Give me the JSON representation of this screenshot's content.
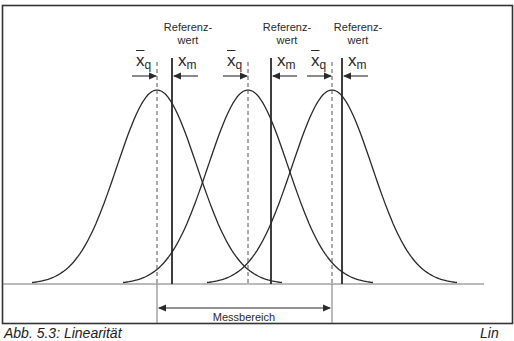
{
  "diagram": {
    "reference_label_line1": "Referenz-",
    "reference_label_line2": "wert",
    "groups": [
      {
        "peak_x": 157,
        "ref_x": 172,
        "xq_label": "x",
        "xq_sub": "q",
        "xm_label": "x",
        "xm_sub": "m",
        "show_ref_label": true
      },
      {
        "peak_x": 248,
        "ref_x": 271,
        "xq_label": "x",
        "xq_sub": "q",
        "xm_label": "x",
        "xm_sub": "m",
        "show_ref_label": true
      },
      {
        "peak_x": 332,
        "ref_x": 342,
        "xq_label": "x",
        "xq_sub": "q",
        "xm_label": "x",
        "xm_sub": "m",
        "show_ref_label": true
      }
    ],
    "range_label": "Messbereich",
    "range_start_x": 157,
    "range_end_x": 332,
    "baseline_y": 284,
    "line_color": "#2a2a2a",
    "frame_color": "#333333"
  },
  "caption": {
    "left": "Abb. 5.3: Linearität",
    "right": "Lin"
  }
}
